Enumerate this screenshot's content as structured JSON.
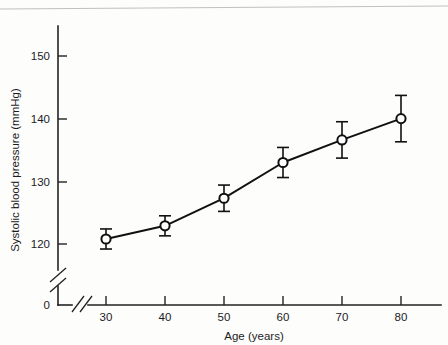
{
  "chart_data": {
    "type": "line",
    "title": "",
    "xlabel": "Age (years)",
    "ylabel": "Systolic blood pressure (mmHg)",
    "x": [
      30,
      40,
      50,
      60,
      70,
      80
    ],
    "values": [
      120.8,
      122.9,
      127.3,
      133.0,
      136.6,
      140.0
    ],
    "errors": [
      1.6,
      1.6,
      2.1,
      2.4,
      2.9,
      3.7
    ],
    "xtick_labels": [
      "30",
      "40",
      "50",
      "60",
      "70",
      "80"
    ],
    "ytick_labels": [
      "120",
      "130",
      "140",
      "150"
    ],
    "ytick_values": [
      120,
      130,
      140,
      150
    ],
    "origin_label": "0",
    "xlim": [
      30,
      80
    ],
    "ylim": [
      118,
      153
    ],
    "grid": false,
    "legend": "none",
    "axis_break_x": true,
    "axis_break_y": true,
    "marker_style": "open-circle",
    "error_bar_style": "capped-vertical",
    "series_name": "Systolic blood pressure by age"
  },
  "axes": {
    "y_title": "Systolic blood pressure (mmHg)",
    "x_title": "Age (years)",
    "origin": "0",
    "y_ticks": [
      {
        "label": "150"
      },
      {
        "label": "140"
      },
      {
        "label": "130"
      },
      {
        "label": "120"
      }
    ],
    "x_ticks": [
      {
        "label": "30"
      },
      {
        "label": "40"
      },
      {
        "label": "50"
      },
      {
        "label": "60"
      },
      {
        "label": "70"
      },
      {
        "label": "80"
      }
    ]
  },
  "colors": {
    "ink": "#111111",
    "axis": "#222222",
    "background": "#fdfdfc",
    "marker_fill": "#ffffff"
  }
}
